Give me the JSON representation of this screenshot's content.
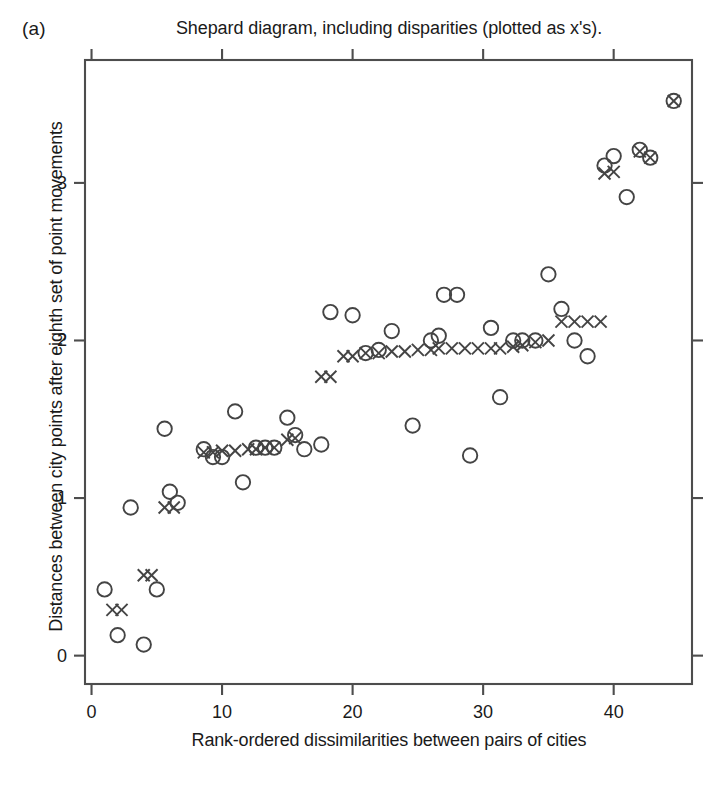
{
  "figure": {
    "panel_label": "(a)",
    "title": "Shepard diagram, including disparities (plotted as x's).",
    "xlabel": "Rank-ordered dissimilarities between pairs of cities",
    "ylabel": "Distances between city points after eighth set of point movements",
    "page_fragment": "",
    "colors": {
      "axis": "#4d4d4d",
      "marker": "#444444",
      "background": "#ffffff"
    }
  },
  "chart_data": {
    "type": "scatter",
    "title": "Shepard diagram, including disparities (plotted as x's).",
    "xlabel": "Rank-ordered dissimilarities between pairs of cities",
    "ylabel": "Distances between city points after eighth set of point movements",
    "xlim": [
      -0.5,
      46.0
    ],
    "ylim": [
      -0.18,
      3.78
    ],
    "xticks": [
      0,
      10,
      20,
      30,
      40
    ],
    "yticks": [
      0,
      1,
      2,
      3
    ],
    "grid": false,
    "legend": null,
    "series": [
      {
        "name": "distances",
        "marker": "circle",
        "points": [
          [
            1.0,
            0.42
          ],
          [
            2.0,
            0.13
          ],
          [
            3.0,
            0.94
          ],
          [
            4.0,
            0.07
          ],
          [
            5.0,
            0.42
          ],
          [
            5.6,
            1.44
          ],
          [
            6.0,
            1.04
          ],
          [
            6.6,
            0.97
          ],
          [
            8.6,
            1.31
          ],
          [
            9.3,
            1.26
          ],
          [
            10.0,
            1.26
          ],
          [
            11.0,
            1.55
          ],
          [
            11.6,
            1.1
          ],
          [
            12.6,
            1.32
          ],
          [
            13.3,
            1.32
          ],
          [
            14.0,
            1.32
          ],
          [
            15.0,
            1.51
          ],
          [
            15.6,
            1.4
          ],
          [
            16.3,
            1.31
          ],
          [
            17.6,
            1.34
          ],
          [
            18.3,
            2.18
          ],
          [
            20.0,
            2.16
          ],
          [
            21.0,
            1.92
          ],
          [
            22.0,
            1.94
          ],
          [
            23.0,
            2.06
          ],
          [
            24.6,
            1.46
          ],
          [
            26.0,
            2.0
          ],
          [
            26.6,
            2.03
          ],
          [
            27.0,
            2.29
          ],
          [
            28.0,
            2.29
          ],
          [
            29.0,
            1.27
          ],
          [
            30.6,
            2.08
          ],
          [
            31.3,
            1.64
          ],
          [
            32.3,
            2.0
          ],
          [
            33.0,
            2.0
          ],
          [
            34.0,
            2.0
          ],
          [
            35.0,
            2.42
          ],
          [
            36.0,
            2.2
          ],
          [
            37.0,
            2.0
          ],
          [
            38.0,
            1.9
          ],
          [
            39.3,
            3.11
          ],
          [
            40.0,
            3.17
          ],
          [
            41.0,
            2.91
          ],
          [
            42.0,
            3.21
          ],
          [
            42.8,
            3.16
          ],
          [
            44.6,
            3.52
          ]
        ]
      },
      {
        "name": "disparities",
        "marker": "x",
        "points": [
          [
            1.6,
            0.29
          ],
          [
            2.3,
            0.29
          ],
          [
            4.0,
            0.51
          ],
          [
            4.6,
            0.51
          ],
          [
            5.6,
            0.94
          ],
          [
            6.3,
            0.94
          ],
          [
            8.6,
            1.29
          ],
          [
            9.3,
            1.29
          ],
          [
            10.0,
            1.3
          ],
          [
            11.0,
            1.3
          ],
          [
            12.0,
            1.31
          ],
          [
            12.6,
            1.31
          ],
          [
            13.3,
            1.32
          ],
          [
            14.0,
            1.32
          ],
          [
            15.0,
            1.37
          ],
          [
            15.6,
            1.38
          ],
          [
            17.6,
            1.77
          ],
          [
            18.3,
            1.77
          ],
          [
            19.3,
            1.9
          ],
          [
            20.0,
            1.9
          ],
          [
            21.0,
            1.92
          ],
          [
            22.0,
            1.92
          ],
          [
            23.0,
            1.93
          ],
          [
            24.0,
            1.93
          ],
          [
            25.0,
            1.94
          ],
          [
            26.0,
            1.94
          ],
          [
            26.6,
            1.95
          ],
          [
            27.6,
            1.95
          ],
          [
            28.6,
            1.95
          ],
          [
            29.6,
            1.95
          ],
          [
            30.6,
            1.95
          ],
          [
            31.3,
            1.95
          ],
          [
            32.3,
            1.96
          ],
          [
            33.0,
            1.97
          ],
          [
            34.0,
            1.99
          ],
          [
            35.0,
            2.0
          ],
          [
            36.0,
            2.12
          ],
          [
            37.0,
            2.12
          ],
          [
            38.0,
            2.12
          ],
          [
            39.0,
            2.12
          ],
          [
            39.3,
            3.06
          ],
          [
            40.0,
            3.07
          ],
          [
            42.0,
            3.2
          ],
          [
            42.8,
            3.16
          ],
          [
            44.6,
            3.52
          ]
        ]
      }
    ]
  }
}
